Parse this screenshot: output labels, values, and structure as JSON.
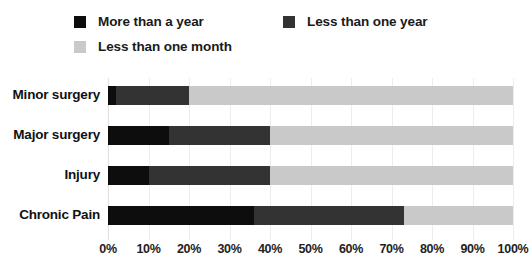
{
  "chart_data": {
    "type": "bar",
    "orientation": "horizontal",
    "stacked": true,
    "stacked_mode": "percent",
    "title": "",
    "subtitle": "",
    "xlabel": "",
    "ylabel": "",
    "xlim": [
      0,
      100
    ],
    "grid": true,
    "grid_axis": "x",
    "legend_position": "top",
    "categories": [
      "Minor surgery",
      "Major surgery",
      "Injury",
      "Chronic Pain"
    ],
    "xtick_labels": [
      "0%",
      "10%",
      "20%",
      "30%",
      "40%",
      "50%",
      "60%",
      "70%",
      "80%",
      "90%",
      "100%"
    ],
    "xtick_values": [
      0,
      10,
      20,
      30,
      40,
      50,
      60,
      70,
      80,
      90,
      100
    ],
    "series": [
      {
        "name": "More than a year",
        "color": "#0d0d0d",
        "values": [
          2,
          15,
          10,
          36
        ]
      },
      {
        "name": "Less than one year",
        "color": "#333333",
        "values": [
          18,
          25,
          30,
          37
        ]
      },
      {
        "name": "Less than one month",
        "color": "#c9c9c9",
        "values": [
          80,
          60,
          60,
          27
        ]
      }
    ]
  },
  "legend": {
    "entries": [
      {
        "label": "More than a year",
        "color": "#0d0d0d"
      },
      {
        "label": "Less than one year",
        "color": "#333333"
      },
      {
        "label": "Less than one month",
        "color": "#c9c9c9"
      }
    ]
  },
  "colors": {
    "background": "#ffffff",
    "gridline": "#ededed",
    "text": "#111111"
  }
}
